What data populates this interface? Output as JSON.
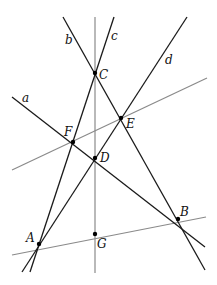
{
  "diagram": {
    "type": "geometric-construction",
    "colors": {
      "dark_line": "#1a1a1a",
      "gray_line": "#8a8a8a",
      "point": "#000000",
      "background": "#ffffff"
    },
    "points": {
      "A": {
        "label": "A",
        "x": 39,
        "y": 244,
        "lx": 26,
        "ly": 242
      },
      "B": {
        "label": "B",
        "x": 178,
        "y": 219,
        "lx": 180,
        "ly": 216
      },
      "C": {
        "label": "C",
        "x": 95,
        "y": 73,
        "lx": 99,
        "ly": 79
      },
      "D": {
        "label": "D",
        "x": 95,
        "y": 158,
        "lx": 100,
        "ly": 162
      },
      "E": {
        "label": "E",
        "x": 121,
        "y": 118,
        "lx": 126,
        "ly": 128
      },
      "F": {
        "label": "F",
        "x": 73,
        "y": 142,
        "lx": 64,
        "ly": 136
      },
      "G": {
        "label": "G",
        "x": 95,
        "y": 234,
        "lx": 97,
        "ly": 248
      }
    },
    "lines": {
      "a": {
        "label": "a",
        "x1": 12,
        "y1": 97,
        "x2": 205,
        "y2": 247,
        "lx": 22,
        "ly": 102,
        "style": "dark"
      },
      "b": {
        "label": "b",
        "x1": 63,
        "y1": 17,
        "x2": 205,
        "y2": 270,
        "lx": 65,
        "ly": 44,
        "style": "dark"
      },
      "c": {
        "label": "c",
        "x1": 114,
        "y1": 17,
        "x2": 30,
        "y2": 272,
        "lx": 111,
        "ly": 40,
        "style": "dark"
      },
      "d": {
        "label": "d",
        "x1": 187,
        "y1": 17,
        "x2": 22,
        "y2": 272,
        "lx": 165,
        "ly": 64,
        "style": "dark"
      },
      "vertical": {
        "label": "",
        "x1": 95,
        "y1": 17,
        "x2": 95,
        "y2": 273,
        "style": "gray"
      },
      "FE": {
        "label": "",
        "x1": 12,
        "y1": 170,
        "x2": 207,
        "y2": 78,
        "style": "gray"
      },
      "AB": {
        "label": "",
        "x1": 12,
        "y1": 255,
        "x2": 206,
        "y2": 217,
        "style": "gray"
      }
    }
  }
}
